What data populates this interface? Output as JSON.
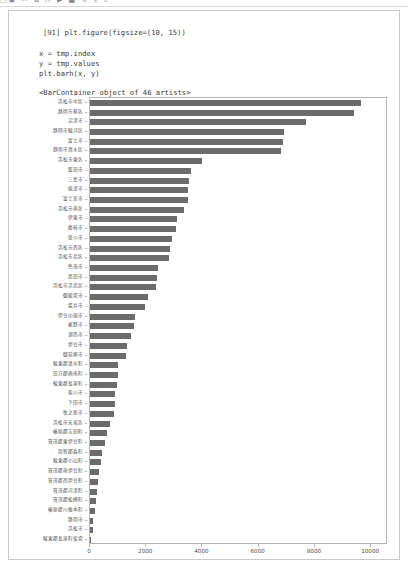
{
  "toolbar": {
    "ink_text": "▢▣  ✂ ⧉ ⎘   ▶ ■ ↻ ⤓   ⌄"
  },
  "cell": {
    "execution_count": "[91]",
    "code_lines": [
      "plt.figure(figsize=(10, 15))",
      "x = tmp.index",
      "y = tmp.values",
      "plt.barh(x, y)"
    ],
    "output_text": "<BarContainer object of 46 artists>"
  },
  "colors": {
    "bar": "#6b6b6b",
    "axis": "#b6b6b6",
    "tick_label": "#4c4c4c",
    "cell_border": "#c9c9c9",
    "code_text": "#3b3b3b"
  },
  "chart_data": {
    "type": "bar",
    "orientation": "horizontal",
    "title": "",
    "xlabel": "",
    "ylabel": "",
    "xlim": [
      0,
      10600
    ],
    "ylim": [
      0,
      46
    ],
    "grid": false,
    "legend": false,
    "xticks": [
      0,
      2000,
      4000,
      6000,
      8000,
      10000
    ],
    "xtick_labels": [
      "0",
      "2000",
      "4000",
      "6000",
      "8000",
      "10000"
    ],
    "n_artists": 46,
    "categories": [
      "浜松市中区",
      "静岡市葵区",
      "沼津市",
      "静岡市駿河区",
      "富士市",
      "静岡市清水区",
      "浜松市東区",
      "磐田市",
      "三島市",
      "焼津市",
      "富士宮市",
      "浜松市南区",
      "伊東市",
      "藤枝市",
      "掛川市",
      "浜松市西区",
      "浜松市北区",
      "熱海市",
      "島田市",
      "浜松市浜北区",
      "御殿場市",
      "袋井市",
      "伊豆の国市",
      "裾野市",
      "湖西市",
      "伊豆市",
      "御前崎市",
      "駿東郡清水町",
      "田方郡函南町",
      "駿東郡長泉町",
      "菊川市",
      "下田市",
      "牧之原市",
      "浜松市天竜区",
      "榛原郡吉田町",
      "賀茂郡東伊豆町",
      "周智郡森町",
      "駿東郡小山町",
      "賀茂郡南伊豆町",
      "賀茂郡西伊豆町",
      "賀茂郡河津町",
      "賀茂郡松崎町",
      "榛原郡川根本町",
      "静岡市",
      "浜松市",
      "駿東郡長泉町役場"
    ],
    "values": [
      9650,
      9400,
      7700,
      6900,
      6850,
      6800,
      4000,
      3580,
      3530,
      3500,
      3480,
      3350,
      3080,
      3050,
      2900,
      2850,
      2820,
      2420,
      2400,
      2350,
      2050,
      1950,
      1600,
      1550,
      1450,
      1320,
      1280,
      1000,
      980,
      950,
      900,
      880,
      840,
      700,
      600,
      540,
      430,
      400,
      330,
      300,
      250,
      210,
      160,
      110,
      90,
      30
    ]
  }
}
